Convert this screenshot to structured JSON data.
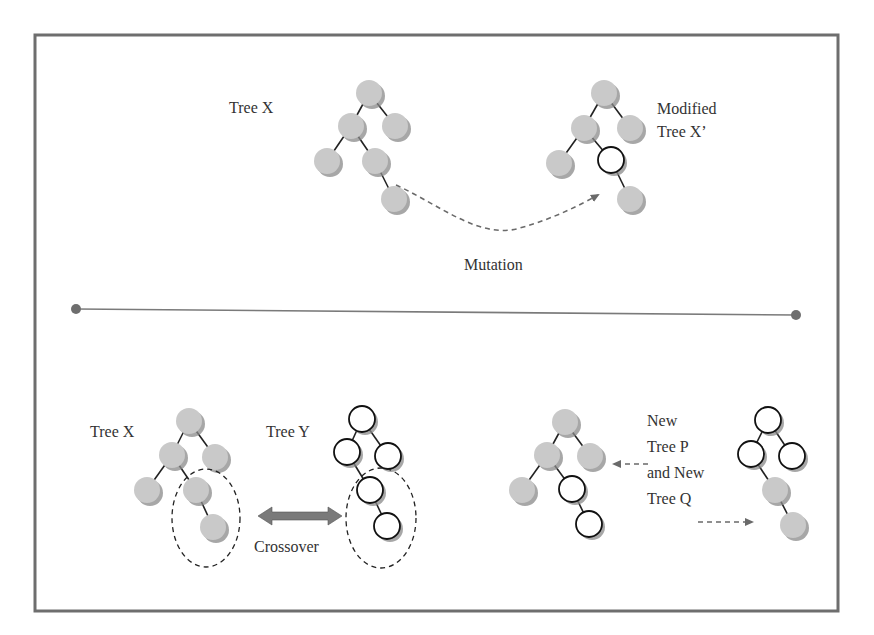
{
  "diagram": {
    "colors": {
      "frame": "#6e6e6e",
      "grey_node": "#c9c9c9",
      "white_node": "#ffffff",
      "node_outline": "#111111",
      "edge": "#222222",
      "dashed_arrow": "#6a6a6a",
      "divider": "#7a7a7a",
      "crossover_arrow": "#7a7a7a",
      "text": "#333333"
    },
    "mutation_panel": {
      "tree_x_label": "Tree X",
      "modified_label_line1": "Modified",
      "modified_label_line2": "Tree X’",
      "operation_label": "Mutation"
    },
    "crossover_panel": {
      "tree_x_label": "Tree X",
      "tree_y_label": "Tree Y",
      "operation_label": "Crossover",
      "result_label_line1": "New",
      "result_label_line2": "Tree P",
      "result_label_line3": "and New",
      "result_label_line4": "Tree Q"
    },
    "trees": [
      {
        "name": "tree-x-mutation",
        "nodes": [
          {
            "x": 369,
            "y": 93,
            "fill": "grey"
          },
          {
            "x": 351,
            "y": 126,
            "fill": "grey"
          },
          {
            "x": 395,
            "y": 126,
            "fill": "grey"
          },
          {
            "x": 327,
            "y": 161,
            "fill": "grey"
          },
          {
            "x": 375,
            "y": 161,
            "fill": "grey"
          },
          {
            "x": 394,
            "y": 199,
            "fill": "grey"
          }
        ],
        "edges": [
          [
            0,
            1
          ],
          [
            0,
            2
          ],
          [
            1,
            3
          ],
          [
            1,
            4
          ],
          [
            4,
            5
          ]
        ]
      },
      {
        "name": "tree-x-prime",
        "nodes": [
          {
            "x": 604,
            "y": 93,
            "fill": "grey"
          },
          {
            "x": 584,
            "y": 128,
            "fill": "grey"
          },
          {
            "x": 630,
            "y": 128,
            "fill": "grey"
          },
          {
            "x": 559,
            "y": 163,
            "fill": "grey"
          },
          {
            "x": 611,
            "y": 160,
            "fill": "white"
          },
          {
            "x": 630,
            "y": 199,
            "fill": "grey"
          }
        ],
        "edges": [
          [
            0,
            1
          ],
          [
            0,
            2
          ],
          [
            1,
            3
          ],
          [
            1,
            4
          ],
          [
            4,
            5
          ]
        ]
      },
      {
        "name": "tree-x-crossover",
        "nodes": [
          {
            "x": 189,
            "y": 421,
            "fill": "grey"
          },
          {
            "x": 172,
            "y": 455,
            "fill": "grey"
          },
          {
            "x": 215,
            "y": 457,
            "fill": "grey"
          },
          {
            "x": 147,
            "y": 490,
            "fill": "grey"
          },
          {
            "x": 196,
            "y": 490,
            "fill": "grey"
          },
          {
            "x": 213,
            "y": 527,
            "fill": "grey"
          }
        ],
        "edges": [
          [
            0,
            1
          ],
          [
            0,
            2
          ],
          [
            1,
            3
          ],
          [
            1,
            4
          ],
          [
            4,
            5
          ]
        ]
      },
      {
        "name": "tree-y",
        "nodes": [
          {
            "x": 362,
            "y": 419,
            "fill": "white"
          },
          {
            "x": 347,
            "y": 452,
            "fill": "white"
          },
          {
            "x": 388,
            "y": 456,
            "fill": "white"
          },
          {
            "x": 370,
            "y": 490,
            "fill": "white"
          },
          {
            "x": 387,
            "y": 526,
            "fill": "white"
          }
        ],
        "edges": [
          [
            0,
            1
          ],
          [
            0,
            2
          ],
          [
            1,
            3
          ],
          [
            3,
            4
          ]
        ]
      },
      {
        "name": "tree-p",
        "nodes": [
          {
            "x": 565,
            "y": 422,
            "fill": "grey"
          },
          {
            "x": 547,
            "y": 455,
            "fill": "grey"
          },
          {
            "x": 590,
            "y": 456,
            "fill": "grey"
          },
          {
            "x": 522,
            "y": 490,
            "fill": "grey"
          },
          {
            "x": 572,
            "y": 489,
            "fill": "white"
          },
          {
            "x": 589,
            "y": 524,
            "fill": "white"
          }
        ],
        "edges": [
          [
            0,
            1
          ],
          [
            0,
            2
          ],
          [
            1,
            3
          ],
          [
            1,
            4
          ],
          [
            4,
            5
          ]
        ]
      },
      {
        "name": "tree-q",
        "nodes": [
          {
            "x": 768,
            "y": 420,
            "fill": "white"
          },
          {
            "x": 751,
            "y": 454,
            "fill": "white"
          },
          {
            "x": 792,
            "y": 456,
            "fill": "white"
          },
          {
            "x": 775,
            "y": 490,
            "fill": "grey"
          },
          {
            "x": 793,
            "y": 525,
            "fill": "grey"
          }
        ],
        "edges": [
          [
            0,
            1
          ],
          [
            0,
            2
          ],
          [
            1,
            3
          ],
          [
            3,
            4
          ]
        ]
      }
    ]
  }
}
